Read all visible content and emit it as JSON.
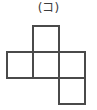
{
  "figure": {
    "label": "(コ)",
    "label_glyph_name": "katakana-ko",
    "type": "cube-net-diagram",
    "stroke_color": "#4a4a4a",
    "fill_color": "#ffffff",
    "background_color": "#ffffff",
    "text_color": "#3c3c3c",
    "grid": {
      "cell_size": 26,
      "origin_x": 7,
      "origin_y": 26,
      "columns": 3,
      "rows": 3,
      "filled_cells": [
        {
          "name": "top-square",
          "col": 1,
          "row": 0
        },
        {
          "name": "middle-left-square",
          "col": 0,
          "row": 1
        },
        {
          "name": "middle-center-square",
          "col": 1,
          "row": 1
        },
        {
          "name": "middle-right-square",
          "col": 2,
          "row": 1
        },
        {
          "name": "bottom-right-square",
          "col": 2,
          "row": 2
        }
      ]
    }
  }
}
